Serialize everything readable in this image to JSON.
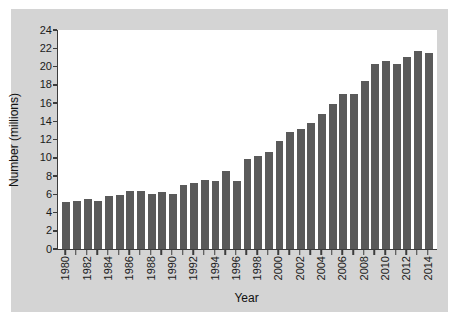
{
  "chart_data": {
    "type": "bar",
    "title": "",
    "xlabel": "Year",
    "ylabel": "Number (millions)",
    "ylim": [
      0,
      24
    ],
    "y_ticks": [
      0,
      2,
      4,
      6,
      8,
      10,
      12,
      14,
      16,
      18,
      20,
      22,
      24
    ],
    "grid": false,
    "legend": "none",
    "bar_color": "#5a5a5a",
    "axis_color": "#3c3c3c",
    "panel_background": "#d4d4d4",
    "plot_background": "#ffffff",
    "x_tick_label_rotation": -90,
    "x_tick_label_interval": 2,
    "categories": [
      "1980",
      "1981",
      "1982",
      "1983",
      "1984",
      "1985",
      "1986",
      "1987",
      "1988",
      "1989",
      "1990",
      "1991",
      "1992",
      "1993",
      "1994",
      "1995",
      "1996",
      "1997",
      "1998",
      "1999",
      "2000",
      "2001",
      "2002",
      "2003",
      "2004",
      "2005",
      "2006",
      "2007",
      "2008",
      "2009",
      "2010",
      "2011",
      "2012",
      "2013",
      "2014"
    ],
    "displayed_tick_labels": [
      "1980",
      "",
      "1982",
      "",
      "1984",
      "",
      "1986",
      "",
      "1988",
      "",
      "1990",
      "",
      "1992",
      "",
      "1994",
      "",
      "1996",
      "",
      "1998",
      "",
      "2000",
      "",
      "2002",
      "",
      "2004",
      "",
      "2006",
      "",
      "2008",
      "",
      "2010",
      "",
      "2012",
      "",
      "2014"
    ],
    "values": [
      5.2,
      5.3,
      5.5,
      5.3,
      5.8,
      5.9,
      6.4,
      6.4,
      6.0,
      6.2,
      6.0,
      7.0,
      7.2,
      7.6,
      7.5,
      8.5,
      7.4,
      9.85,
      10.2,
      10.6,
      11.8,
      12.8,
      13.2,
      13.8,
      14.8,
      15.9,
      17.0,
      17.0,
      18.4,
      20.25,
      20.6,
      20.25,
      21.0,
      21.75,
      21.5
    ]
  }
}
